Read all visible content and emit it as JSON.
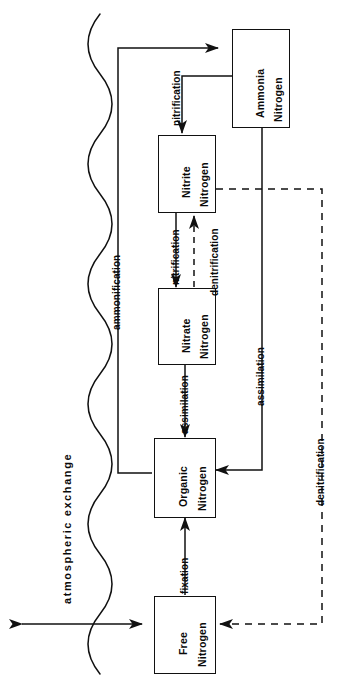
{
  "figure": {
    "orientation": "rotated-90-ccw",
    "background_color": "#ffffff",
    "line_color": "#111111",
    "text_color": "#0a0a0a"
  },
  "nodes": [
    {
      "id": "ammonia",
      "line1": "Ammonia",
      "line2": "Nitrogen"
    },
    {
      "id": "nitrite",
      "line1": "Nitrite",
      "line2": "Nitrogen"
    },
    {
      "id": "nitrate",
      "line1": "Nitrate",
      "line2": "Nitrogen"
    },
    {
      "id": "organic",
      "line1": "Organic",
      "line2": "Nitrogen"
    },
    {
      "id": "free",
      "line1": "Free",
      "line2": "Nitrogen"
    }
  ],
  "edges": [
    {
      "id": "ammonification",
      "label": "ammonification",
      "style": "solid",
      "from": "organic",
      "to": "ammonia"
    },
    {
      "id": "nitrification-1",
      "label": "nitrification",
      "style": "solid",
      "from": "ammonia",
      "to": "nitrite"
    },
    {
      "id": "nitrification-2",
      "label": "nitrification",
      "style": "solid",
      "from": "nitrite",
      "to": "nitrate"
    },
    {
      "id": "denitrification-1",
      "label": "denitrification",
      "style": "dashed",
      "from": "nitrate",
      "to": "nitrite"
    },
    {
      "id": "assimilation-1",
      "label": "assimilation",
      "style": "solid",
      "from": "nitrate",
      "to": "organic"
    },
    {
      "id": "assimilation-2",
      "label": "assimilation",
      "style": "solid",
      "from": "ammonia",
      "to": "organic"
    },
    {
      "id": "fixation",
      "label": "fixation",
      "style": "solid",
      "from": "free",
      "to": "organic"
    },
    {
      "id": "denitrification-2",
      "label": "denitrification",
      "style": "dashed",
      "from": "nitrite",
      "to": "free"
    }
  ],
  "boundary": {
    "id": "atmospheric-exchange",
    "label": "atmospheric exchange",
    "description": "wavy line separating atmosphere from soil/water with a double headed arrow crossing it"
  }
}
